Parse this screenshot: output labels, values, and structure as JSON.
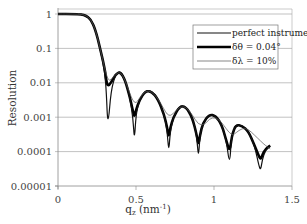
{
  "chart_data": {
    "type": "line",
    "title": "",
    "xlabel": "q_z (nm^-1)",
    "xlabel_main": "q",
    "xlabel_sub": "z",
    "xlabel_unit": " (nm",
    "xlabel_sup": "-1",
    "xlabel_close": ")",
    "ylabel": "Resolution",
    "xlim": [
      0,
      1.5
    ],
    "ylim": [
      1e-05,
      1
    ],
    "yscale": "log",
    "grid": "horizontal major",
    "x_ticks": [
      "0",
      "0.5",
      "1",
      "1.5"
    ],
    "x_tick_values": [
      0,
      0.5,
      1,
      1.5
    ],
    "y_ticks": [
      "1",
      "0.1",
      "0.01",
      "0.001",
      "0.0001",
      "0.00001"
    ],
    "y_tick_values": [
      1,
      0.1,
      0.01,
      0.001,
      0.0001,
      1e-05
    ],
    "legend_position": "upper right",
    "series": [
      {
        "name": "perfect instrument",
        "width": 1.2,
        "color": "#111111",
        "x": [
          0,
          0.1,
          0.15,
          0.18,
          0.21,
          0.24,
          0.27,
          0.3,
          0.31,
          0.32,
          0.34,
          0.37,
          0.4,
          0.43,
          0.46,
          0.48,
          0.49,
          0.5,
          0.52,
          0.56,
          0.6,
          0.64,
          0.68,
          0.7,
          0.71,
          0.72,
          0.74,
          0.78,
          0.82,
          0.86,
          0.89,
          0.9,
          0.91,
          0.93,
          0.97,
          1.01,
          1.05,
          1.08,
          1.1,
          1.11,
          1.12,
          1.14,
          1.18,
          1.22,
          1.26,
          1.29,
          1.3,
          1.31,
          1.33,
          1.36
        ],
        "y": [
          1,
          1,
          0.98,
          0.9,
          0.7,
          0.35,
          0.1,
          0.02,
          0.005,
          0.0005,
          0.006,
          0.018,
          0.022,
          0.012,
          0.004,
          0.001,
          0.0002,
          0.0012,
          0.003,
          0.006,
          0.0058,
          0.0035,
          0.0012,
          0.0004,
          9e-05,
          0.0004,
          0.001,
          0.0022,
          0.0021,
          0.001,
          0.0003,
          6e-05,
          0.0003,
          0.0007,
          0.0012,
          0.0011,
          0.0006,
          0.0002,
          4e-05,
          0.0002,
          0.00035,
          0.0006,
          0.00058,
          0.0004,
          0.00015,
          3.5e-05,
          3e-05,
          6e-05,
          0.00011,
          0.00014
        ]
      },
      {
        "name": "δθ = 0.04°",
        "width": 2.6,
        "color": "#000000",
        "x": [
          0,
          0.1,
          0.15,
          0.18,
          0.21,
          0.24,
          0.27,
          0.3,
          0.31,
          0.32,
          0.34,
          0.37,
          0.4,
          0.43,
          0.46,
          0.48,
          0.49,
          0.5,
          0.52,
          0.56,
          0.6,
          0.64,
          0.68,
          0.7,
          0.71,
          0.72,
          0.74,
          0.78,
          0.82,
          0.86,
          0.89,
          0.9,
          0.91,
          0.93,
          0.97,
          1.01,
          1.05,
          1.08,
          1.1,
          1.11,
          1.12,
          1.14,
          1.18,
          1.22,
          1.26,
          1.29,
          1.3,
          1.31,
          1.33,
          1.36
        ],
        "y": [
          1,
          1,
          0.98,
          0.9,
          0.7,
          0.35,
          0.1,
          0.025,
          0.011,
          0.008,
          0.01,
          0.018,
          0.021,
          0.012,
          0.004,
          0.0015,
          0.001,
          0.0016,
          0.003,
          0.0058,
          0.0056,
          0.0034,
          0.0012,
          0.0005,
          0.00025,
          0.0005,
          0.001,
          0.0021,
          0.002,
          0.001,
          0.0003,
          0.00015,
          0.0003,
          0.0007,
          0.0012,
          0.0011,
          0.0006,
          0.0002,
          0.0001,
          0.0002,
          0.00035,
          0.0006,
          0.00056,
          0.0004,
          0.00015,
          7e-05,
          6e-05,
          8e-05,
          0.00012,
          0.00015
        ]
      },
      {
        "name": "δλ = 10%",
        "width": 0.7,
        "color": "#555555",
        "x": [
          0,
          0.1,
          0.15,
          0.18,
          0.21,
          0.24,
          0.27,
          0.3,
          0.32,
          0.34,
          0.37,
          0.4,
          0.43,
          0.46,
          0.48,
          0.5,
          0.52,
          0.56,
          0.6,
          0.64,
          0.68,
          0.7,
          0.72,
          0.74,
          0.78,
          0.82,
          0.86,
          0.9,
          0.94,
          0.97,
          1.01,
          1.05,
          1.08,
          1.1,
          1.12,
          1.14,
          1.18,
          1.22,
          1.26,
          1.3,
          1.33,
          1.36
        ],
        "y": [
          1,
          1,
          0.98,
          0.9,
          0.7,
          0.35,
          0.1,
          0.025,
          0.012,
          0.012,
          0.018,
          0.021,
          0.012,
          0.005,
          0.003,
          0.0025,
          0.0035,
          0.0058,
          0.0056,
          0.0035,
          0.0017,
          0.0012,
          0.0011,
          0.0013,
          0.002,
          0.002,
          0.0012,
          0.0006,
          0.0006,
          0.0009,
          0.001,
          0.0007,
          0.00045,
          0.00035,
          0.0003,
          0.00035,
          0.00048,
          0.00045,
          0.0003,
          0.0002,
          0.00015,
          0.00012
        ]
      }
    ]
  }
}
